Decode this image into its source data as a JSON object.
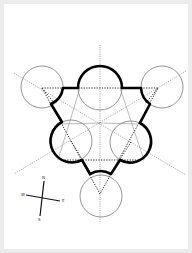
{
  "diagram": {
    "type": "geometric-construction",
    "colors": {
      "background": "#ffffff",
      "frame": "#ececec",
      "thick_outline": "#000000",
      "circle_stroke": "#777777",
      "construction_lines": "#555555"
    },
    "center": [
      100,
      123
    ],
    "circles": [
      {
        "id": "top-left",
        "cx": 42,
        "cy": 87,
        "r": 21
      },
      {
        "id": "top-right",
        "cx": 162,
        "cy": 87,
        "r": 21
      },
      {
        "id": "top-middle",
        "cx": 100,
        "cy": 88,
        "r": 22
      },
      {
        "id": "middle-left",
        "cx": 71,
        "cy": 141,
        "r": 21
      },
      {
        "id": "middle-right",
        "cx": 131,
        "cy": 142,
        "r": 21
      },
      {
        "id": "bottom",
        "cx": 101,
        "cy": 196,
        "r": 21
      }
    ],
    "dotted_triangle": [
      [
        42,
        88
      ],
      [
        158,
        88
      ],
      [
        100,
        194
      ]
    ],
    "axes": {
      "vertical": [
        [
          100,
          45
        ],
        [
          100,
          222
        ]
      ],
      "diagonal_1": [
        [
          14,
          73
        ],
        [
          186,
          175
        ]
      ],
      "diagonal_2": [
        [
          186,
          71
        ],
        [
          14,
          174
        ]
      ]
    }
  },
  "compass": {
    "center": [
      42,
      198
    ],
    "labels": {
      "top": "N",
      "left": "W",
      "right": "E",
      "bottom": "S"
    }
  }
}
